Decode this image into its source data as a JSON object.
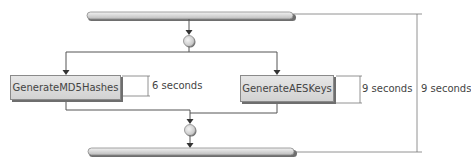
{
  "diagram": {
    "type": "activity-diagram",
    "fork_bar": {
      "label": ""
    },
    "activities": [
      {
        "name": "GenerateMD5Hashes",
        "duration": "6 seconds"
      },
      {
        "name": "GenerateAESKeys",
        "duration": "9 seconds"
      }
    ],
    "join_bar": {
      "label": ""
    },
    "total_duration": "9 seconds"
  },
  "colors": {
    "line": "#555555",
    "box_fill": "#dcdcdc",
    "bar_fill": "#d8d8d8",
    "text": "#444444"
  }
}
